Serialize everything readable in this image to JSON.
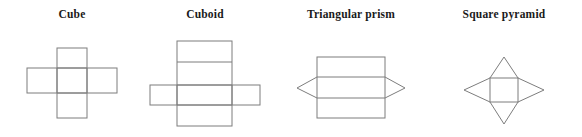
{
  "figure": {
    "background_color": "#ffffff",
    "line_color": "#7d7d7d",
    "label_color": "#1a1a1a",
    "width": 582,
    "height": 137
  },
  "shapes": [
    {
      "id": "cube",
      "label": "Cube",
      "label_x": 72,
      "label_y": 18,
      "net_type": "cross",
      "description": "Cube net drawn as a cross of six equal squares",
      "face_count": 6,
      "geometry": {
        "horizontal_bar": {
          "x": 27,
          "y": 68,
          "width": 90,
          "height": 25
        },
        "vertical_bar": {
          "x": 57,
          "y": 48,
          "width": 30,
          "height": 70
        },
        "internal_vertical_lines": [
          57,
          87
        ],
        "internal_horizontal_lines": [
          68,
          93
        ]
      }
    },
    {
      "id": "cuboid",
      "label": "Cuboid",
      "label_x": 205,
      "label_y": 18,
      "net_type": "cross",
      "description": "Cuboid net drawn as a tall strip of four rectangles crossed by a wide strip",
      "face_count": 6,
      "geometry": {
        "horizontal_bar": {
          "x": 150,
          "y": 85,
          "width": 110,
          "height": 20
        },
        "vertical_bar": {
          "x": 177,
          "y": 41,
          "width": 55,
          "height": 85
        },
        "internal_vertical_lines": [
          177,
          232
        ],
        "internal_horizontal_lines": [
          62,
          85,
          105
        ]
      }
    },
    {
      "id": "triangular-prism",
      "label": "Triangular prism",
      "label_x": 351,
      "label_y": 18,
      "net_type": "rectangle-with-side-triangles",
      "description": "Three stacked rectangles with a triangle on each side of the middle rectangle",
      "face_count": 5,
      "geometry": {
        "rectangle": {
          "x": 317,
          "y": 57,
          "width": 68,
          "height": 61
        },
        "internal_horizontal_lines": [
          77,
          98
        ],
        "left_triangle_apex": {
          "x": 297,
          "y": 88
        },
        "right_triangle_apex": {
          "x": 405,
          "y": 88
        }
      }
    },
    {
      "id": "square-pyramid",
      "label": "Square pyramid",
      "label_x": 504,
      "label_y": 18,
      "net_type": "square-with-four-triangles",
      "description": "Central square with four triangles folding up to a common apex",
      "face_count": 5,
      "geometry": {
        "square": {
          "x": 490,
          "y": 78,
          "width": 28,
          "height": 24
        },
        "top_apex": {
          "x": 504,
          "y": 57
        },
        "bottom_apex": {
          "x": 504,
          "y": 124
        },
        "left_apex": {
          "x": 464,
          "y": 90
        },
        "right_apex": {
          "x": 544,
          "y": 90
        }
      }
    }
  ]
}
